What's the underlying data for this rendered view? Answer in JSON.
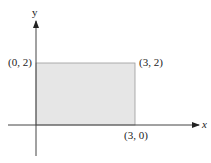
{
  "diagram": {
    "axes": {
      "x_label": "x",
      "y_label": "y"
    },
    "rectangle": {
      "fill": "#e6e6e6",
      "stroke": "#888888",
      "vertices": [
        {
          "label": "(0, 2)"
        },
        {
          "label": "(3, 2)"
        },
        {
          "label": "(3, 0)"
        }
      ]
    }
  }
}
